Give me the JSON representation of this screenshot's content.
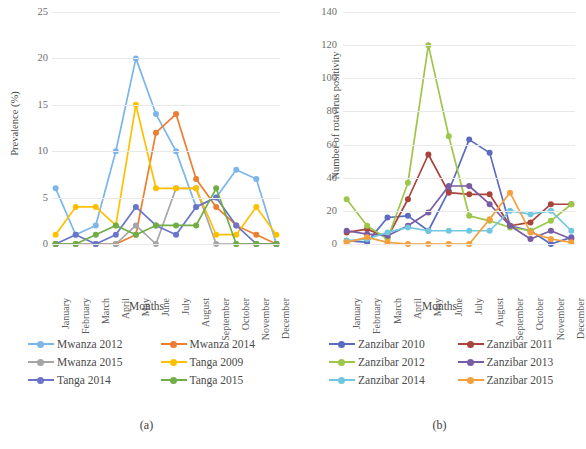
{
  "figure": {
    "panels": [
      {
        "caption": "(a)",
        "xlabel": "Months",
        "ylabel": "Prevalence (%)"
      },
      {
        "caption": "(b)",
        "xlabel": "Months",
        "ylabel": "Number of rotavirus positivity"
      }
    ]
  },
  "chart_data": [
    {
      "type": "line",
      "title": "",
      "panel": "(a)",
      "xlabel": "Months",
      "ylabel": "Prevalence (%)",
      "ylim": [
        0,
        25
      ],
      "yticks": [
        0,
        5,
        10,
        15,
        20,
        25
      ],
      "grid": true,
      "legend_position": "bottom",
      "categories": [
        "January",
        "February",
        "March",
        "April",
        "May",
        "June",
        "July",
        "August",
        "September",
        "October",
        "November",
        "December"
      ],
      "series": [
        {
          "name": "Mwanza 2012",
          "color": "#7cb5e8",
          "values": [
            6,
            1,
            2,
            10,
            20,
            14,
            10,
            4,
            5,
            8,
            7,
            0
          ]
        },
        {
          "name": "Mwanza 2014",
          "color": "#ed7d31",
          "values": [
            0,
            0,
            0,
            0,
            1,
            12,
            14,
            7,
            4,
            2,
            1,
            0
          ]
        },
        {
          "name": "Mwanza 2015",
          "color": "#a5a5a5",
          "values": [
            0,
            0,
            0,
            0,
            2,
            0,
            6,
            6,
            0,
            0,
            0,
            0
          ]
        },
        {
          "name": "Tanga  2009",
          "color": "#ffc000",
          "values": [
            1,
            4,
            4,
            2,
            15,
            6,
            6,
            6,
            1,
            1,
            4,
            1
          ]
        },
        {
          "name": "Tanga 2014",
          "color": "#6a75c9",
          "values": [
            0,
            1,
            0,
            1,
            4,
            2,
            1,
            4,
            5,
            2,
            0,
            0
          ]
        },
        {
          "name": "Tanga 2015",
          "color": "#70ad47",
          "values": [
            0,
            0,
            1,
            2,
            1,
            2,
            2,
            2,
            6,
            0,
            0,
            0
          ]
        }
      ]
    },
    {
      "type": "line",
      "title": "",
      "panel": "(b)",
      "xlabel": "Months",
      "ylabel": "Number of rotavirus positivity",
      "ylim": [
        0,
        140
      ],
      "yticks": [
        0,
        20,
        40,
        60,
        80,
        100,
        120,
        140
      ],
      "grid": true,
      "legend_position": "bottom",
      "categories": [
        "January",
        "February",
        "March",
        "April",
        "May",
        "June",
        "July",
        "August",
        "September",
        "October",
        "November",
        "December"
      ],
      "series": [
        {
          "name": "Zanzibar 2010",
          "color": "#5b6bbf",
          "values": [
            2,
            1,
            16,
            17,
            8,
            32,
            63,
            55,
            11,
            8,
            0,
            4
          ]
        },
        {
          "name": "Zanzibar 2011",
          "color": "#a8443c",
          "values": [
            7,
            9,
            4,
            27,
            54,
            31,
            30,
            30,
            11,
            13,
            24,
            24
          ]
        },
        {
          "name": "Zanzibar 2012",
          "color": "#9dc64a",
          "values": [
            27,
            11,
            3,
            37,
            120,
            65,
            17,
            14,
            10,
            8,
            14,
            24
          ]
        },
        {
          "name": "Zanzibar 2013",
          "color": "#7a5ba5",
          "values": [
            8,
            6,
            5,
            11,
            19,
            35,
            35,
            24,
            11,
            3,
            8,
            3
          ]
        },
        {
          "name": "Zanzibar 2014",
          "color": "#72c7e0",
          "values": [
            2,
            3,
            7,
            10,
            8,
            8,
            8,
            8,
            20,
            18,
            20,
            8
          ]
        },
        {
          "name": "Zanzibar 2015",
          "color": "#f4a03c",
          "values": [
            1,
            4,
            1,
            0,
            0,
            0,
            0,
            15,
            31,
            7,
            3,
            1
          ]
        }
      ]
    }
  ]
}
